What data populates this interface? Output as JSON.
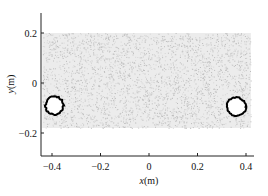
{
  "chart_data": {
    "type": "scatter",
    "title": "",
    "xlabel_var": "x",
    "xlabel_unit": "(m)",
    "ylabel_var": "y",
    "ylabel_unit": "(m)",
    "xlim": [
      -0.44,
      0.43
    ],
    "ylim": [
      -0.29,
      0.28
    ],
    "xticks": [
      -0.4,
      -0.2,
      0,
      0.2,
      0.4
    ],
    "xtick_labels": [
      "−0.4",
      "−0.2",
      "0",
      "0.2",
      "0.4"
    ],
    "yticks": [
      -0.2,
      0,
      0.2
    ],
    "ytick_labels": [
      "−0.2",
      "0",
      "0.2"
    ],
    "grid": false,
    "legend": null,
    "series": [
      {
        "name": "particles",
        "kind": "random-dense-points",
        "color": "#bdbdbd",
        "region": {
          "x": [
            -0.44,
            0.42
          ],
          "y": [
            -0.18,
            0.2
          ]
        },
        "count": 3200
      },
      {
        "name": "left-ring",
        "kind": "ring",
        "color": "#000000",
        "center": [
          -0.39,
          -0.09
        ],
        "radius": 0.037
      },
      {
        "name": "right-ring",
        "kind": "ring",
        "color": "#000000",
        "center": [
          0.36,
          -0.095
        ],
        "radius": 0.039
      }
    ]
  },
  "plot": {
    "x_axis_label_var": "x",
    "x_axis_label_unit": "(m)",
    "y_axis_label_var": "y",
    "y_axis_label_unit": "(m)"
  }
}
